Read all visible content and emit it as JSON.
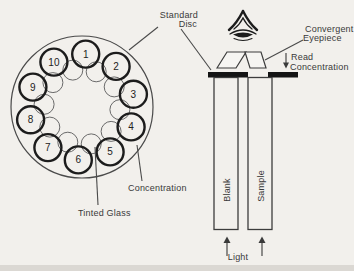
{
  "colors": {
    "ink": "#1c1c1c",
    "paper": "#f2f0ec",
    "label_text": "#3a3a3a"
  },
  "disc": {
    "numbers": [
      "1",
      "2",
      "3",
      "4",
      "5",
      "6",
      "7",
      "8",
      "9",
      "10"
    ]
  },
  "labels": {
    "standard_disc": [
      "Standard",
      "Disc"
    ],
    "convergent_eyepiece": [
      "Convergent",
      "Eyepiece"
    ],
    "read_concentration": [
      "Read",
      "Concentration"
    ],
    "concentration": "Concentration",
    "tinted_glass": "Tinted Glass",
    "blank": "Blank",
    "sample": "Sample",
    "light": "Light"
  },
  "icons": {
    "eye": "eye-icon",
    "down_arrow": "down-arrow-icon",
    "light_arrows": "up-arrow-icon"
  }
}
